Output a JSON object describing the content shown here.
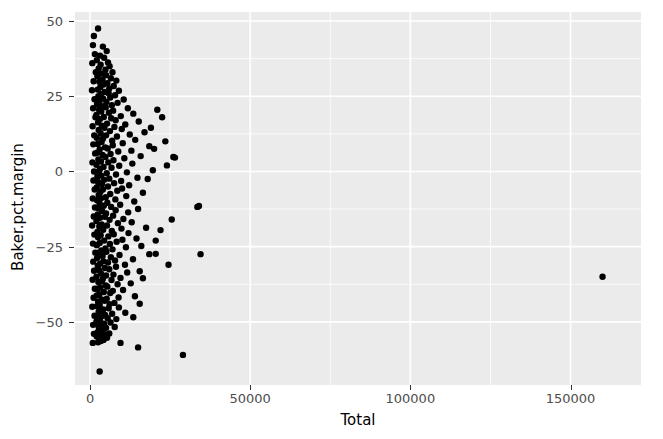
{
  "chart_data": {
    "type": "scatter",
    "title": "",
    "xlabel": "Total",
    "ylabel": "Baker.pct.margin",
    "xlim": [
      -4700,
      172000
    ],
    "ylim": [
      -71,
      53
    ],
    "grid": true,
    "legend": "none",
    "point_color": "#000000",
    "point_size": 3.2,
    "panel_background": "#ebebeb",
    "gridline_color": "#ffffff",
    "xticks": [
      0,
      50000,
      100000,
      150000
    ],
    "xtick_labels": [
      "0",
      "50000",
      "100000",
      "150000"
    ],
    "yticks": [
      -50,
      -25,
      0,
      25,
      50
    ],
    "ytick_labels": [
      "-50",
      "-25",
      "0",
      "25",
      "50"
    ],
    "x_minor_ticks": [
      25000,
      75000,
      125000
    ],
    "y_minor_ticks": [
      -37.5,
      -12.5,
      12.5,
      37.5
    ],
    "n_points": 312,
    "points": [
      [
        2500,
        47.5
      ],
      [
        4000,
        41.5
      ],
      [
        5200,
        40.0
      ],
      [
        3100,
        38.5
      ],
      [
        4400,
        37.8
      ],
      [
        2100,
        37.0
      ],
      [
        5600,
        36.2
      ],
      [
        3300,
        35.5
      ],
      [
        6100,
        35.0
      ],
      [
        2700,
        34.2
      ],
      [
        4800,
        33.8
      ],
      [
        7000,
        33.0
      ],
      [
        3600,
        32.5
      ],
      [
        5000,
        32.0
      ],
      [
        2300,
        31.6
      ],
      [
        6500,
        31.0
      ],
      [
        3900,
        30.5
      ],
      [
        8200,
        30.2
      ],
      [
        2900,
        29.8
      ],
      [
        5400,
        29.3
      ],
      [
        4200,
        28.9
      ],
      [
        7400,
        28.4
      ],
      [
        3200,
        28.0
      ],
      [
        6000,
        27.6
      ],
      [
        2400,
        27.2
      ],
      [
        9000,
        26.8
      ],
      [
        4600,
        26.4
      ],
      [
        5800,
        26.0
      ],
      [
        3400,
        25.7
      ],
      [
        7800,
        25.3
      ],
      [
        2600,
        25.0
      ],
      [
        6300,
        24.6
      ],
      [
        4100,
        24.2
      ],
      [
        10500,
        23.9
      ],
      [
        3000,
        23.5
      ],
      [
        5100,
        23.1
      ],
      [
        8600,
        22.8
      ],
      [
        2200,
        22.4
      ],
      [
        6800,
        22.0
      ],
      [
        3800,
        21.7
      ],
      [
        4900,
        21.3
      ],
      [
        11800,
        21.0
      ],
      [
        2800,
        20.6
      ],
      [
        7200,
        20.2
      ],
      [
        3500,
        19.9
      ],
      [
        5900,
        19.5
      ],
      [
        13500,
        19.2
      ],
      [
        2000,
        18.8
      ],
      [
        9600,
        18.4
      ],
      [
        4300,
        18.1
      ],
      [
        6600,
        17.7
      ],
      [
        3100,
        17.4
      ],
      [
        8000,
        17.0
      ],
      [
        15200,
        16.6
      ],
      [
        2500,
        16.3
      ],
      [
        5300,
        15.9
      ],
      [
        11000,
        15.6
      ],
      [
        3700,
        15.2
      ],
      [
        7600,
        14.8
      ],
      [
        4500,
        14.5
      ],
      [
        9900,
        14.1
      ],
      [
        2700,
        13.8
      ],
      [
        6200,
        13.4
      ],
      [
        17000,
        13.0
      ],
      [
        3300,
        12.7
      ],
      [
        12400,
        12.3
      ],
      [
        5000,
        12.0
      ],
      [
        8400,
        11.6
      ],
      [
        2100,
        11.2
      ],
      [
        4000,
        10.9
      ],
      [
        14100,
        10.5
      ],
      [
        6900,
        10.2
      ],
      [
        3600,
        9.8
      ],
      [
        10200,
        9.4
      ],
      [
        2400,
        9.1
      ],
      [
        7100,
        8.7
      ],
      [
        18500,
        8.4
      ],
      [
        4700,
        8.0
      ],
      [
        5500,
        7.6
      ],
      [
        3000,
        7.3
      ],
      [
        12900,
        6.9
      ],
      [
        8800,
        6.6
      ],
      [
        2200,
        6.2
      ],
      [
        6400,
        5.8
      ],
      [
        3900,
        5.5
      ],
      [
        15800,
        5.1
      ],
      [
        4800,
        4.8
      ],
      [
        10700,
        4.4
      ],
      [
        2600,
        4.0
      ],
      [
        7300,
        3.7
      ],
      [
        26500,
        4.6
      ],
      [
        3400,
        3.3
      ],
      [
        5700,
        3.0
      ],
      [
        13200,
        2.6
      ],
      [
        2000,
        2.2
      ],
      [
        9100,
        1.9
      ],
      [
        4200,
        1.5
      ],
      [
        6700,
        1.2
      ],
      [
        3100,
        0.8
      ],
      [
        19600,
        0.4
      ],
      [
        2800,
        0.1
      ],
      [
        11500,
        -0.3
      ],
      [
        5200,
        -0.6
      ],
      [
        8100,
        -1.0
      ],
      [
        3500,
        -1.4
      ],
      [
        2300,
        -1.7
      ],
      [
        14800,
        -2.1
      ],
      [
        6000,
        -2.4
      ],
      [
        4400,
        -2.8
      ],
      [
        9700,
        -3.2
      ],
      [
        2500,
        -3.5
      ],
      [
        7500,
        -3.9
      ],
      [
        3700,
        -4.2
      ],
      [
        12200,
        -4.6
      ],
      [
        5600,
        -5.0
      ],
      [
        2100,
        -5.3
      ],
      [
        10000,
        -5.7
      ],
      [
        4000,
        -6.0
      ],
      [
        8500,
        -6.4
      ],
      [
        3200,
        -6.8
      ],
      [
        16500,
        -7.1
      ],
      [
        6300,
        -7.5
      ],
      [
        2700,
        -7.8
      ],
      [
        11300,
        -8.2
      ],
      [
        4900,
        -8.6
      ],
      [
        3400,
        -8.9
      ],
      [
        7900,
        -9.3
      ],
      [
        2200,
        -9.6
      ],
      [
        13800,
        -10.0
      ],
      [
        5400,
        -10.4
      ],
      [
        34000,
        -11.5
      ],
      [
        3000,
        -10.7
      ],
      [
        9400,
        -11.1
      ],
      [
        4300,
        -11.4
      ],
      [
        6600,
        -11.8
      ],
      [
        2600,
        -12.2
      ],
      [
        15000,
        -12.5
      ],
      [
        8000,
        -12.9
      ],
      [
        3800,
        -13.2
      ],
      [
        11900,
        -13.6
      ],
      [
        5000,
        -14.0
      ],
      [
        2400,
        -14.3
      ],
      [
        7200,
        -14.7
      ],
      [
        4600,
        -15.1
      ],
      [
        3100,
        -15.4
      ],
      [
        10400,
        -15.8
      ],
      [
        6100,
        -16.1
      ],
      [
        2000,
        -16.5
      ],
      [
        13000,
        -16.9
      ],
      [
        8700,
        -17.2
      ],
      [
        3600,
        -17.6
      ],
      [
        5300,
        -18.0
      ],
      [
        2900,
        -18.3
      ],
      [
        17500,
        -18.7
      ],
      [
        9800,
        -19.0
      ],
      [
        4100,
        -19.4
      ],
      [
        6800,
        -19.8
      ],
      [
        2300,
        -20.1
      ],
      [
        12000,
        -20.5
      ],
      [
        7400,
        -20.9
      ],
      [
        3300,
        -21.2
      ],
      [
        5700,
        -21.6
      ],
      [
        2500,
        -21.9
      ],
      [
        14500,
        -22.3
      ],
      [
        10100,
        -22.7
      ],
      [
        4400,
        -23.0
      ],
      [
        8300,
        -23.4
      ],
      [
        3000,
        -23.8
      ],
      [
        6200,
        -24.1
      ],
      [
        2100,
        -24.5
      ],
      [
        16000,
        -24.8
      ],
      [
        11200,
        -25.2
      ],
      [
        4800,
        -25.6
      ],
      [
        7000,
        -25.9
      ],
      [
        3500,
        -26.3
      ],
      [
        5100,
        -26.7
      ],
      [
        2700,
        -27.0
      ],
      [
        20500,
        -27.4
      ],
      [
        9200,
        -27.8
      ],
      [
        3900,
        -28.1
      ],
      [
        6500,
        -28.5
      ],
      [
        2200,
        -28.8
      ],
      [
        13400,
        -29.2
      ],
      [
        7800,
        -29.6
      ],
      [
        4200,
        -29.9
      ],
      [
        5600,
        -30.3
      ],
      [
        3100,
        -30.7
      ],
      [
        10900,
        -31.0
      ],
      [
        2400,
        -31.4
      ],
      [
        8100,
        -31.7
      ],
      [
        4600,
        -32.1
      ],
      [
        6000,
        -32.5
      ],
      [
        2800,
        -32.8
      ],
      [
        15500,
        -33.2
      ],
      [
        11600,
        -33.6
      ],
      [
        3400,
        -33.9
      ],
      [
        7300,
        -34.3
      ],
      [
        5000,
        -34.6
      ],
      [
        2000,
        -35.0
      ],
      [
        9500,
        -35.4
      ],
      [
        4000,
        -35.7
      ],
      [
        6700,
        -36.1
      ],
      [
        3700,
        -36.5
      ],
      [
        2600,
        -36.8
      ],
      [
        12700,
        -37.2
      ],
      [
        8600,
        -37.5
      ],
      [
        4900,
        -37.9
      ],
      [
        5400,
        -38.3
      ],
      [
        3200,
        -38.6
      ],
      [
        2300,
        -39.0
      ],
      [
        10300,
        -39.4
      ],
      [
        7100,
        -39.7
      ],
      [
        4300,
        -40.1
      ],
      [
        6300,
        -40.4
      ],
      [
        2900,
        -40.8
      ],
      [
        2100,
        -41.2
      ],
      [
        14000,
        -41.5
      ],
      [
        8900,
        -41.9
      ],
      [
        5200,
        -42.3
      ],
      [
        3600,
        -42.6
      ],
      [
        4500,
        -43.0
      ],
      [
        2500,
        -43.3
      ],
      [
        7600,
        -43.7
      ],
      [
        6100,
        -44.1
      ],
      [
        3000,
        -44.4
      ],
      [
        2200,
        -44.8
      ],
      [
        9000,
        -45.2
      ],
      [
        5800,
        -45.5
      ],
      [
        4100,
        -45.9
      ],
      [
        3300,
        -46.2
      ],
      [
        2700,
        -46.6
      ],
      [
        11000,
        -47.0
      ],
      [
        6900,
        -47.3
      ],
      [
        4700,
        -47.7
      ],
      [
        3800,
        -48.1
      ],
      [
        2400,
        -48.4
      ],
      [
        5500,
        -48.8
      ],
      [
        8200,
        -49.1
      ],
      [
        3100,
        -49.5
      ],
      [
        2000,
        -49.9
      ],
      [
        6400,
        -50.2
      ],
      [
        4400,
        -50.6
      ],
      [
        3500,
        -51.0
      ],
      [
        2600,
        -51.3
      ],
      [
        7700,
        -51.7
      ],
      [
        5000,
        -52.0
      ],
      [
        2800,
        -52.4
      ],
      [
        4000,
        -52.8
      ],
      [
        3200,
        -53.1
      ],
      [
        2300,
        -53.5
      ],
      [
        6000,
        -53.9
      ],
      [
        4800,
        -54.2
      ],
      [
        3700,
        -54.6
      ],
      [
        2100,
        -54.9
      ],
      [
        5300,
        -55.3
      ],
      [
        2900,
        -55.7
      ],
      [
        4200,
        -56.0
      ],
      [
        3400,
        -56.4
      ],
      [
        2500,
        -56.8
      ],
      [
        9500,
        -57.0
      ],
      [
        15000,
        -58.5
      ],
      [
        29000,
        -61.0
      ],
      [
        3000,
        -66.5
      ],
      [
        1200,
        45.0
      ],
      [
        900,
        42.0
      ],
      [
        1500,
        39.0
      ],
      [
        700,
        36.0
      ],
      [
        1800,
        33.0
      ],
      [
        1100,
        30.0
      ],
      [
        600,
        27.0
      ],
      [
        1400,
        24.0
      ],
      [
        950,
        21.0
      ],
      [
        1700,
        18.0
      ],
      [
        800,
        15.0
      ],
      [
        1300,
        12.0
      ],
      [
        1000,
        9.0
      ],
      [
        1600,
        6.0
      ],
      [
        750,
        3.0
      ],
      [
        1250,
        0.0
      ],
      [
        1050,
        -3.0
      ],
      [
        1450,
        -6.0
      ],
      [
        850,
        -9.0
      ],
      [
        1550,
        -12.0
      ],
      [
        1150,
        -15.0
      ],
      [
        650,
        -18.0
      ],
      [
        1350,
        -21.0
      ],
      [
        900,
        -24.0
      ],
      [
        1650,
        -27.0
      ],
      [
        1000,
        -30.0
      ],
      [
        1250,
        -33.0
      ],
      [
        800,
        -36.0
      ],
      [
        1500,
        -39.0
      ],
      [
        1100,
        -42.0
      ],
      [
        700,
        -45.0
      ],
      [
        1400,
        -48.0
      ],
      [
        950,
        -51.0
      ],
      [
        1200,
        -54.0
      ],
      [
        850,
        -57.0
      ],
      [
        21000,
        20.5
      ],
      [
        22500,
        18.0
      ],
      [
        19000,
        14.5
      ],
      [
        23500,
        10.0
      ],
      [
        20000,
        7.5
      ],
      [
        24000,
        2.0
      ],
      [
        18000,
        -2.5
      ],
      [
        25500,
        -16.0
      ],
      [
        22000,
        -19.5
      ],
      [
        20500,
        -23.0
      ],
      [
        18500,
        -27.5
      ],
      [
        24500,
        -31.0
      ],
      [
        16500,
        -35.5
      ],
      [
        15500,
        -44.0
      ],
      [
        13500,
        -48.5
      ],
      [
        26000,
        4.8
      ],
      [
        33500,
        -11.8
      ],
      [
        34500,
        -27.5
      ],
      [
        160000,
        -35.0
      ]
    ],
    "outlier_note": "one point at approximately (160000, -35)"
  },
  "axis": {
    "y_title": "Baker.pct.margin",
    "x_title": "Total"
  }
}
